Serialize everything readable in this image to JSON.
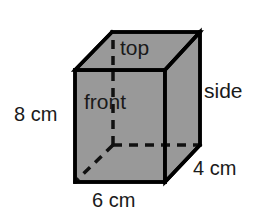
{
  "figure": {
    "background_color": "#ffffff",
    "fill_color": "#999999",
    "stroke_color": "#000000",
    "text_color": "#1a1a1a"
  },
  "face_labels": {
    "top": "top",
    "front": "front",
    "side": "side"
  },
  "dimensions": {
    "height": "8 cm",
    "width": "6 cm",
    "depth": "4 cm"
  },
  "shape_data": {
    "type": "rectangular-prism",
    "projection": "oblique",
    "vertices": {
      "front_top_left": [
        75,
        70
      ],
      "front_top_right": [
        165,
        70
      ],
      "front_bottom_right": [
        165,
        182
      ],
      "front_bottom_left": [
        75,
        182
      ],
      "back_top_left": [
        112,
        32
      ],
      "back_top_right": [
        200,
        32
      ],
      "back_bottom_right": [
        200,
        145
      ],
      "back_bottom_left_hidden": [
        113,
        145
      ]
    },
    "visible_faces": [
      "front",
      "top",
      "side"
    ],
    "hidden_edges": [
      [
        [
          113,
          145
        ],
        [
          75,
          182
        ]
      ],
      [
        [
          113,
          145
        ],
        [
          113,
          32
        ]
      ],
      [
        [
          113,
          145
        ],
        [
          200,
          145
        ]
      ]
    ]
  }
}
